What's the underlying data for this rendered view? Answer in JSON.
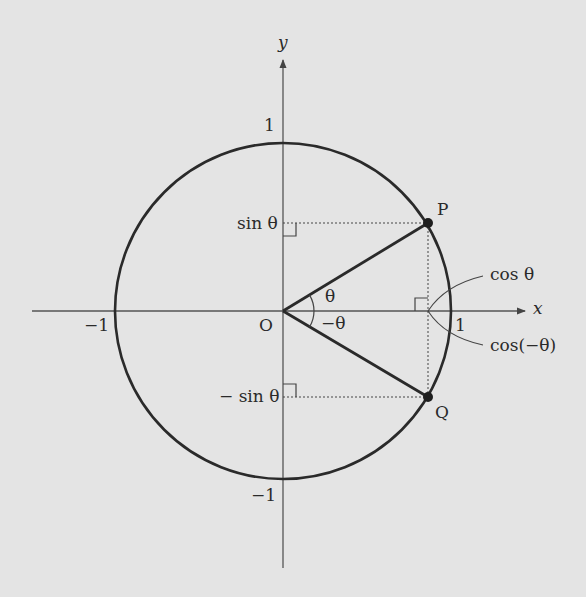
{
  "diagram": {
    "axes": {
      "x_label": "x",
      "y_label": "y",
      "origin_label": "O"
    },
    "ticks": {
      "x_pos": "1",
      "x_neg": "−1",
      "y_pos": "1",
      "y_neg": "−1"
    },
    "points": {
      "P": "P",
      "Q": "Q"
    },
    "angles": {
      "theta": "θ",
      "neg_theta": "−θ"
    },
    "projections": {
      "sin_theta": "sin θ",
      "neg_sin_theta": "− sin θ",
      "cos_theta": "cos θ",
      "cos_neg_theta": "cos(−θ)"
    },
    "colors": {
      "background": "#e4e4e4",
      "ink": "#2a2a2a",
      "axis": "#555555"
    }
  }
}
